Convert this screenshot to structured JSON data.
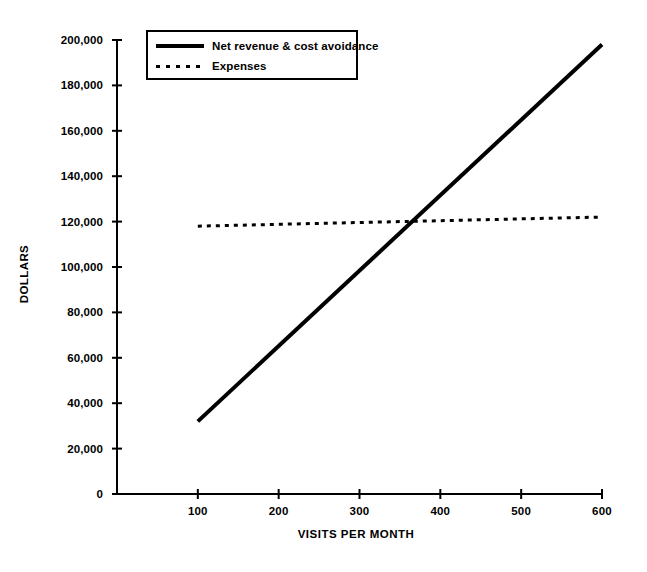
{
  "chart_data": {
    "type": "line",
    "title": "",
    "xlabel": "VISITS PER MONTH",
    "ylabel": "DOLLARS",
    "xlim": [
      0,
      600
    ],
    "ylim": [
      0,
      200000
    ],
    "grid": false,
    "legend_position": "top-left",
    "x_ticks": [
      "0",
      "100",
      "200",
      "300",
      "400",
      "500",
      "600"
    ],
    "y_ticks": [
      "0",
      "20,000",
      "40,000",
      "60,000",
      "80,000",
      "100,000",
      "120,000",
      "140,000",
      "160,000",
      "180,000",
      "200,000"
    ],
    "series": [
      {
        "name": "Net revenue & cost avoidance",
        "style": "solid",
        "linewidth": 4,
        "color": "#000000",
        "x": [
          100,
          600
        ],
        "values": [
          32000,
          198000
        ]
      },
      {
        "name": "Expenses",
        "style": "dotted",
        "linewidth": 3,
        "color": "#000000",
        "x": [
          100,
          600
        ],
        "values": [
          118000,
          122000
        ]
      }
    ],
    "annotations": [
      {
        "label": "break-even intersection",
        "x": 355,
        "y": 120000
      }
    ]
  },
  "legend": {
    "items": [
      {
        "label": "Net revenue & cost avoidance",
        "style": "solid"
      },
      {
        "label": "Expenses",
        "style": "dotted"
      }
    ]
  }
}
